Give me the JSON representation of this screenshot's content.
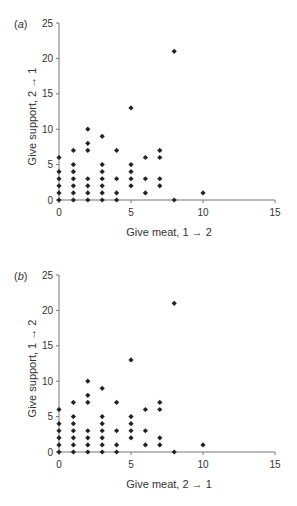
{
  "chart_data": [
    {
      "type": "scatter",
      "panel_label": "(a)",
      "xlabel": "Give meat, 1 → 2",
      "ylabel": "Give support, 2 → 1",
      "xlim": [
        0,
        15
      ],
      "ylim": [
        0,
        25
      ],
      "xticks": [
        0,
        5,
        10,
        15
      ],
      "yticks": [
        0,
        5,
        10,
        15,
        20,
        25
      ],
      "grid": false,
      "marker": "diamond",
      "points": [
        [
          0,
          0
        ],
        [
          0,
          1
        ],
        [
          0,
          2
        ],
        [
          0,
          3
        ],
        [
          0,
          4
        ],
        [
          0,
          6
        ],
        [
          1,
          0
        ],
        [
          1,
          1
        ],
        [
          1,
          2
        ],
        [
          1,
          3
        ],
        [
          1,
          4
        ],
        [
          1,
          5
        ],
        [
          1,
          7
        ],
        [
          2,
          0
        ],
        [
          2,
          1
        ],
        [
          2,
          2
        ],
        [
          2,
          3
        ],
        [
          2,
          7
        ],
        [
          2,
          8
        ],
        [
          2,
          10
        ],
        [
          3,
          0
        ],
        [
          3,
          1
        ],
        [
          3,
          2
        ],
        [
          3,
          3
        ],
        [
          3,
          4
        ],
        [
          3,
          5
        ],
        [
          3,
          9
        ],
        [
          4,
          0
        ],
        [
          4,
          1
        ],
        [
          4,
          3
        ],
        [
          4,
          7
        ],
        [
          5,
          2
        ],
        [
          5,
          3
        ],
        [
          5,
          4
        ],
        [
          5,
          5
        ],
        [
          5,
          13
        ],
        [
          6,
          1
        ],
        [
          6,
          3
        ],
        [
          6,
          6
        ],
        [
          7,
          2
        ],
        [
          7,
          3
        ],
        [
          7,
          6
        ],
        [
          7,
          7
        ],
        [
          8,
          0
        ],
        [
          8,
          21
        ],
        [
          10,
          1
        ]
      ]
    },
    {
      "type": "scatter",
      "panel_label": "(b)",
      "xlabel": "Give meat, 2 → 1",
      "ylabel": "Give support, 1 → 2",
      "xlim": [
        0,
        15
      ],
      "ylim": [
        0,
        25
      ],
      "xticks": [
        0,
        5,
        10,
        15
      ],
      "yticks": [
        0,
        5,
        10,
        15,
        20,
        25
      ],
      "grid": false,
      "marker": "diamond",
      "points": [
        [
          0,
          0
        ],
        [
          0,
          1
        ],
        [
          0,
          2
        ],
        [
          0,
          3
        ],
        [
          0,
          4
        ],
        [
          0,
          6
        ],
        [
          1,
          0
        ],
        [
          1,
          1
        ],
        [
          1,
          2
        ],
        [
          1,
          3
        ],
        [
          1,
          4
        ],
        [
          1,
          5
        ],
        [
          1,
          7
        ],
        [
          2,
          0
        ],
        [
          2,
          1
        ],
        [
          2,
          2
        ],
        [
          2,
          3
        ],
        [
          2,
          7
        ],
        [
          2,
          8
        ],
        [
          2,
          10
        ],
        [
          3,
          0
        ],
        [
          3,
          1
        ],
        [
          3,
          2
        ],
        [
          3,
          3
        ],
        [
          3,
          4
        ],
        [
          3,
          5
        ],
        [
          3,
          9
        ],
        [
          4,
          0
        ],
        [
          4,
          1
        ],
        [
          4,
          3
        ],
        [
          4,
          7
        ],
        [
          5,
          2
        ],
        [
          5,
          3
        ],
        [
          5,
          4
        ],
        [
          5,
          5
        ],
        [
          5,
          13
        ],
        [
          6,
          1
        ],
        [
          6,
          3
        ],
        [
          6,
          6
        ],
        [
          7,
          1
        ],
        [
          7,
          2
        ],
        [
          7,
          6
        ],
        [
          7,
          7
        ],
        [
          8,
          0
        ],
        [
          8,
          21
        ],
        [
          10,
          1
        ]
      ]
    }
  ],
  "style": {
    "axis_color": "#777777",
    "marker_color": "#222222",
    "text_color": "#333333"
  }
}
